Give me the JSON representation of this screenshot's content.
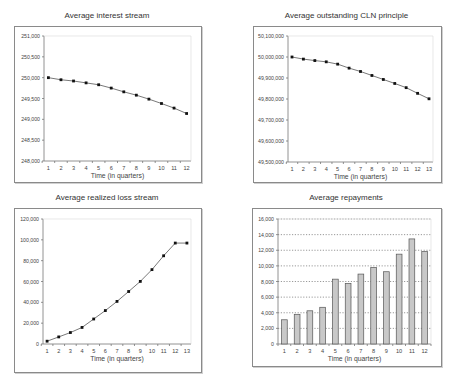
{
  "chart_data": [
    {
      "id": "interest",
      "type": "line",
      "title": "Average interest stream",
      "xlabel": "Time (in quarters)",
      "ylabel": "",
      "categories": [
        "1",
        "2",
        "3",
        "4",
        "5",
        "6",
        "7",
        "8",
        "9",
        "10",
        "11",
        "12"
      ],
      "values": [
        250000,
        249950,
        249920,
        249875,
        249830,
        249750,
        249660,
        249580,
        249485,
        249380,
        249270,
        249140
      ],
      "ylim": [
        248000,
        251000
      ],
      "yticks": [
        248000,
        248500,
        249000,
        249500,
        250000,
        250500,
        251000
      ],
      "ytick_labels": [
        "248,000",
        "248,500",
        "249,000",
        "249,500",
        "250,000",
        "250,500",
        "251,000"
      ],
      "grid": false,
      "legend": "none"
    },
    {
      "id": "principal",
      "type": "line",
      "title": "Average outstanding CLN principle",
      "xlabel": "Time (in quarters)",
      "ylabel": "",
      "categories": [
        "1",
        "2",
        "3",
        "4",
        "5",
        "6",
        "7",
        "8",
        "9",
        "10",
        "11",
        "12",
        "13"
      ],
      "values": [
        50000000,
        49990000,
        49983000,
        49977000,
        49966000,
        49947000,
        49931000,
        49912000,
        49893000,
        49874000,
        49854000,
        49827000,
        49801000
      ],
      "ylim": [
        49500000,
        50100000
      ],
      "yticks": [
        49500000,
        49600000,
        49700000,
        49800000,
        49900000,
        50000000,
        50100000
      ],
      "ytick_labels": [
        "49,500,000",
        "49,600,000",
        "49,700,000",
        "49,800,000",
        "49,900,000",
        "50,000,000",
        "50,100,000"
      ],
      "grid": false,
      "legend": "none"
    },
    {
      "id": "loss",
      "type": "line",
      "title": "Average realized loss stream",
      "xlabel": "Time (in quarters)",
      "ylabel": "",
      "categories": [
        "1",
        "2",
        "3",
        "4",
        "5",
        "6",
        "7",
        "8",
        "9",
        "10",
        "11",
        "12",
        "13"
      ],
      "values": [
        2700,
        6800,
        11000,
        15900,
        24000,
        32100,
        40900,
        50400,
        60100,
        71400,
        84700,
        96900,
        96900
      ],
      "ylim": [
        0,
        120000
      ],
      "yticks": [
        0,
        20000,
        40000,
        60000,
        80000,
        100000,
        120000
      ],
      "ytick_labels": [
        "0",
        "20,000",
        "40,000",
        "60,000",
        "80,000",
        "100,000",
        "120,000"
      ],
      "grid": false,
      "legend": "none"
    },
    {
      "id": "repayments",
      "type": "bar",
      "title": "Average repayments",
      "xlabel": "Time (in quarters)",
      "ylabel": "",
      "categories": [
        "1",
        "2",
        "3",
        "4",
        "5",
        "6",
        "7",
        "8",
        "9",
        "10",
        "11",
        "12"
      ],
      "values": [
        3100,
        3800,
        4250,
        4700,
        8300,
        7750,
        8950,
        9800,
        9250,
        11500,
        13450,
        11850
      ],
      "ylim": [
        0,
        16000
      ],
      "yticks": [
        0,
        2000,
        4000,
        6000,
        8000,
        10000,
        12000,
        14000,
        16000
      ],
      "ytick_labels": [
        "0",
        "2,000",
        "4,000",
        "6,000",
        "8,000",
        "10,000",
        "12,000",
        "14,000",
        "16,000"
      ],
      "grid": true,
      "legend": "none"
    }
  ],
  "colors": {
    "line": "#555555",
    "marker": "#111111",
    "bar_fill": "#c8c8c8",
    "bar_stroke": "#555555",
    "axis": "#777777",
    "grid": "#555555",
    "frame": "#8a8a8a"
  }
}
